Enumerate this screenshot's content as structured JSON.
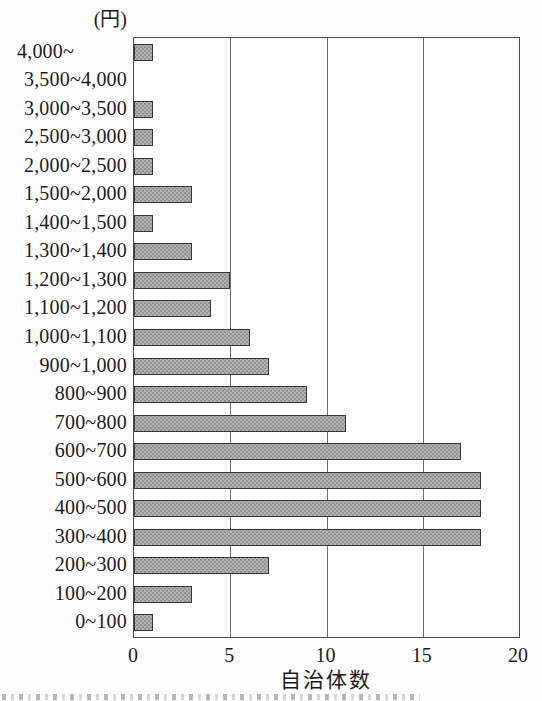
{
  "chart_data": {
    "type": "bar",
    "orientation": "horizontal",
    "title": "",
    "xlabel": "自治体数",
    "ylabel": "(円)",
    "categories": [
      "4,000~",
      "3,500~4,000",
      "3,000~3,500",
      "2,500~3,000",
      "2,000~2,500",
      "1,500~2,000",
      "1,400~1,500",
      "1,300~1,400",
      "1,200~1,300",
      "1,100~1,200",
      "1,000~1,100",
      "900~1,000",
      "800~900",
      "700~800",
      "600~700",
      "500~600",
      "400~500",
      "300~400",
      "200~300",
      "100~200",
      "0~100"
    ],
    "values": [
      1,
      0,
      1,
      1,
      1,
      3,
      1,
      3,
      5,
      4,
      6,
      7,
      9,
      11,
      17,
      18,
      18,
      18,
      7,
      3,
      1
    ],
    "xlim": [
      0,
      20
    ],
    "xticks": [
      0,
      5,
      10,
      15,
      20
    ],
    "grid": true,
    "legend": "none",
    "bar_fill_color": "#b3b3b3",
    "bar_dot_color": "#949494",
    "bar_border_color": "#383838",
    "axis_color": "#4a4a4a",
    "gridline_color": "#6e6e6e"
  }
}
